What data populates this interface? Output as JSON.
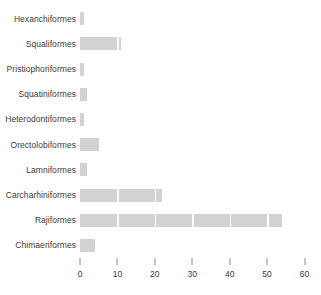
{
  "chart_data": {
    "type": "bar",
    "orientation": "horizontal",
    "title": "",
    "subtitle": "",
    "xlabel": "",
    "ylabel": "",
    "categories": [
      "Hexanchiformes",
      "Squaliformes",
      "Pristiophoriformes",
      "Squatiniformes",
      "Heterodontiformes",
      "Orectolobiformes",
      "Lamniformes",
      "Carcharhiniformes",
      "Rajiformes",
      "Chimaeriformes"
    ],
    "values": [
      1,
      11,
      1,
      2,
      1,
      5,
      2,
      22,
      54,
      4
    ],
    "xlim": [
      0,
      62
    ],
    "xticks": [
      0,
      10,
      20,
      30,
      40,
      50,
      60
    ],
    "xtick_labels": [
      "0",
      "10",
      "20",
      "30",
      "40",
      "50",
      "60"
    ],
    "grid": true,
    "grid_orientation": "vertical",
    "legend": null,
    "legend_position": "none",
    "bar_color": "#d2d2d2",
    "gridline_color": "#ffffff",
    "axis_color": "#8c8c8c",
    "text_color": "#3b3b3b",
    "background_color": "#ffffff"
  }
}
